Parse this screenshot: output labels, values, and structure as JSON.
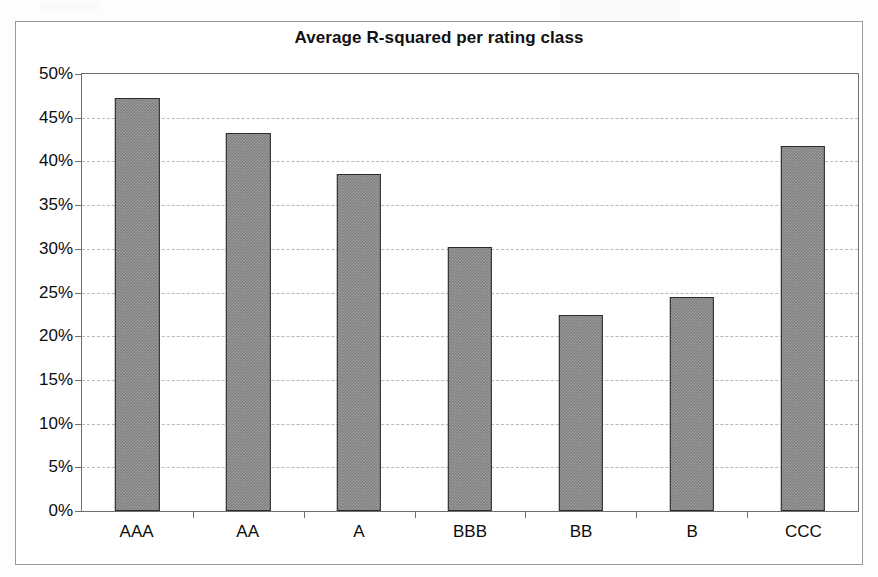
{
  "chart_data": {
    "type": "bar",
    "title": "Average R-squared per rating class",
    "xlabel": "",
    "ylabel": "",
    "categories": [
      "AAA",
      "AA",
      "A",
      "BBB",
      "BB",
      "B",
      "CCC"
    ],
    "values": [
      47.2,
      43.2,
      38.6,
      30.2,
      22.4,
      24.5,
      41.8
    ],
    "value_unit": "%",
    "ylim": [
      0,
      50
    ],
    "ytick_labels": [
      "50%",
      "45%",
      "40%",
      "35%",
      "30%",
      "25%",
      "20%",
      "15%",
      "10%",
      "5%",
      "0%"
    ],
    "ytick_values": [
      50,
      45,
      40,
      35,
      30,
      25,
      20,
      15,
      10,
      5,
      0
    ],
    "grid": true,
    "grid_style": "dashed",
    "legend": false,
    "legend_position": "none",
    "series": [
      {
        "name": "Average R-squared",
        "values": [
          47.2,
          43.2,
          38.6,
          30.2,
          22.4,
          24.5,
          41.8
        ]
      }
    ],
    "colors": {
      "bar_fill": "#7d7d7d",
      "bar_border": "#2b2b2b",
      "gridline": "#b9b9b9",
      "axis": "#6f6f6f",
      "text": "#0d0d0d",
      "background": "#ffffff"
    }
  }
}
